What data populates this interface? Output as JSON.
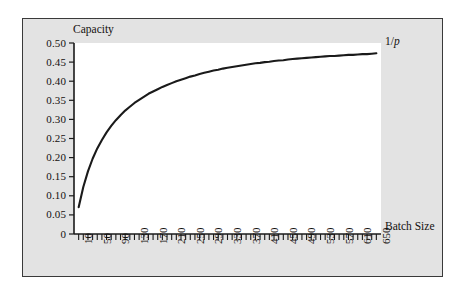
{
  "figure": {
    "background_color": "#e3e3e3",
    "plot_background_color": "#ffffff",
    "border_color": "#3a3a3a",
    "curve_color": "#1a1a1a"
  },
  "labels": {
    "y_axis_title": "Capacity",
    "x_axis_title": "Batch Size",
    "asymptote_prefix": "1/",
    "asymptote_symbol": "p"
  },
  "chart_data": {
    "type": "line",
    "title": "",
    "xlabel": "Batch Size",
    "ylabel": "Capacity",
    "xlim": [
      0,
      660
    ],
    "ylim": [
      0,
      0.5
    ],
    "grid": false,
    "legend": null,
    "y_ticklabels": [
      "0.50",
      "0.45",
      "0.40",
      "0.35",
      "0.30",
      "0.25",
      "0.20",
      "0.15",
      "0.10",
      "0.05",
      "0"
    ],
    "y_tickvalues": [
      0.5,
      0.45,
      0.4,
      0.35,
      0.3,
      0.25,
      0.2,
      0.15,
      0.1,
      0.05,
      0
    ],
    "x_ticklabels": [
      "10",
      "50",
      "90",
      "130",
      "170",
      "210",
      "250",
      "290",
      "330",
      "370",
      "410",
      "450",
      "490",
      "530",
      "570",
      "610",
      "650"
    ],
    "x_tickvalues": [
      10,
      50,
      90,
      130,
      170,
      210,
      250,
      290,
      330,
      370,
      410,
      450,
      490,
      530,
      570,
      610,
      650
    ],
    "minor_tick_step": 10,
    "annotations": [
      {
        "text": "1/p",
        "value": 0.5,
        "position": "top-right",
        "describes": "horizontal asymptote of capacity"
      }
    ],
    "series": [
      {
        "name": "Capacity",
        "x": [
          10,
          20,
          30,
          40,
          50,
          60,
          70,
          80,
          90,
          100,
          110,
          120,
          130,
          140,
          150,
          160,
          170,
          180,
          190,
          200,
          210,
          220,
          230,
          240,
          250,
          260,
          270,
          280,
          290,
          300,
          310,
          320,
          330,
          340,
          350,
          360,
          370,
          380,
          390,
          400,
          410,
          420,
          430,
          440,
          450,
          460,
          470,
          480,
          490,
          500,
          510,
          520,
          530,
          540,
          550,
          560,
          570,
          580,
          590,
          600,
          610,
          620,
          630,
          640,
          650
        ],
        "values": [
          0.07,
          0.123,
          0.164,
          0.197,
          0.224,
          0.246,
          0.266,
          0.283,
          0.298,
          0.311,
          0.323,
          0.333,
          0.343,
          0.351,
          0.359,
          0.367,
          0.373,
          0.379,
          0.385,
          0.39,
          0.395,
          0.4,
          0.404,
          0.408,
          0.412,
          0.415,
          0.419,
          0.422,
          0.425,
          0.428,
          0.43,
          0.433,
          0.435,
          0.437,
          0.439,
          0.441,
          0.443,
          0.445,
          0.447,
          0.448,
          0.45,
          0.451,
          0.453,
          0.454,
          0.455,
          0.457,
          0.458,
          0.459,
          0.46,
          0.461,
          0.462,
          0.463,
          0.464,
          0.465,
          0.466,
          0.466,
          0.467,
          0.468,
          0.469,
          0.469,
          0.47,
          0.471,
          0.471,
          0.472,
          0.473
        ]
      }
    ]
  }
}
